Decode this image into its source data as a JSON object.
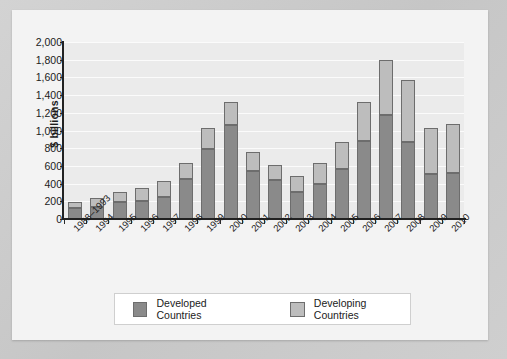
{
  "chart_data": {
    "type": "bar",
    "subtype": "stacked-vertical",
    "title": "",
    "xlabel": "",
    "ylabel": "$ billions",
    "ylim": [
      0,
      2000
    ],
    "ytick_step": 200,
    "yticks": [
      "2,000",
      "1,800",
      "1,600",
      "1,400",
      "1,200",
      "1,000",
      "800",
      "600",
      "400",
      "200",
      "0"
    ],
    "grid": true,
    "grid_axis": "y",
    "legend_position": "bottom",
    "categories": [
      "1988–1993",
      "1994",
      "1995",
      "1996",
      "1997",
      "1998",
      "1999",
      "2000",
      "2001",
      "2002",
      "2003",
      "2004",
      "2005",
      "2006",
      "2007",
      "2008",
      "2009",
      "2010"
    ],
    "series": [
      {
        "name": "Developed Countries",
        "color": "#8a8a8a",
        "values": [
          130,
          140,
          190,
          200,
          250,
          450,
          790,
          1060,
          540,
          440,
          300,
          400,
          560,
          880,
          1170,
          870,
          510,
          520
        ]
      },
      {
        "name": "Developing Countries",
        "color": "#bdbdbd",
        "values": [
          60,
          100,
          120,
          150,
          180,
          180,
          240,
          260,
          220,
          170,
          185,
          230,
          310,
          440,
          630,
          700,
          520,
          550
        ]
      }
    ],
    "totals": [
      190,
      240,
      310,
      350,
      430,
      630,
      1030,
      1320,
      760,
      610,
      485,
      630,
      870,
      1320,
      1800,
      1570,
      1030,
      1070
    ]
  },
  "legend": {
    "items": [
      {
        "label": "Developed Countries",
        "color": "#8a8a8a"
      },
      {
        "label": "Developing Countries",
        "color": "#bdbdbd"
      }
    ]
  },
  "colors": {
    "developed": "#8a8a8a",
    "developing": "#bdbdbd",
    "plot_background": "#ebebeb",
    "card_background": "#f3f3f3",
    "page_background": "#cdcdcd",
    "axis": "#222222",
    "gridline": "#fbfbfb"
  }
}
